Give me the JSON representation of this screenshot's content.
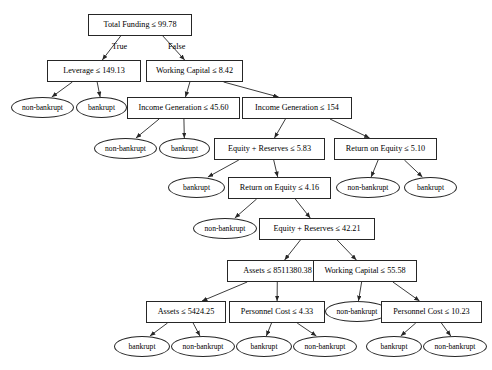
{
  "diagram": {
    "type": "decision-tree",
    "title": "",
    "label_true": "True",
    "label_false": "False",
    "stroke_color": "#262626",
    "fill_color": "#ffffff",
    "text_color": "#000000",
    "nodes": [
      {
        "id": "n0",
        "kind": "decision",
        "label": "Total Funding ≤ 99.78",
        "x": 88,
        "y": 14,
        "w": 104,
        "h": 22,
        "font": 8.2
      },
      {
        "id": "n1",
        "kind": "decision",
        "label": "Leverage ≤ 149.13",
        "x": 47,
        "y": 60,
        "w": 94,
        "h": 22,
        "font": 8.2
      },
      {
        "id": "n2",
        "kind": "decision",
        "label": "Working Capital ≤ 8.42",
        "x": 146,
        "y": 60,
        "w": 97,
        "h": 22,
        "font": 8.2
      },
      {
        "id": "n3",
        "kind": "leaf",
        "label": "non-bankrupt",
        "x": 11,
        "y": 97,
        "w": 63,
        "h": 21,
        "font": 7.6
      },
      {
        "id": "n4",
        "kind": "leaf",
        "label": "bankrupt",
        "x": 76,
        "y": 97,
        "w": 51,
        "h": 21,
        "font": 7.6
      },
      {
        "id": "n5",
        "kind": "decision",
        "label": "Income Generation ≤ 45.60",
        "x": 127,
        "y": 97,
        "w": 113,
        "h": 22,
        "font": 8.2
      },
      {
        "id": "n6",
        "kind": "decision",
        "label": "Income Generation ≤ 154",
        "x": 242,
        "y": 97,
        "w": 110,
        "h": 22,
        "font": 8.2
      },
      {
        "id": "n7",
        "kind": "leaf",
        "label": "non-bankrupt",
        "x": 94,
        "y": 138,
        "w": 63,
        "h": 21,
        "font": 7.6
      },
      {
        "id": "n8",
        "kind": "leaf",
        "label": "bankrupt",
        "x": 159,
        "y": 138,
        "w": 51,
        "h": 21,
        "font": 7.6
      },
      {
        "id": "n9",
        "kind": "decision",
        "label": "Equity + Reserves ≤ 5.83",
        "x": 214,
        "y": 138,
        "w": 111,
        "h": 22,
        "font": 8.2
      },
      {
        "id": "n10",
        "kind": "decision",
        "label": "Return on Equity ≤ 5.10",
        "x": 334,
        "y": 138,
        "w": 103,
        "h": 22,
        "font": 8.2
      },
      {
        "id": "n11",
        "kind": "leaf",
        "label": "bankrupt",
        "x": 168,
        "y": 177,
        "w": 57,
        "h": 21,
        "font": 7.6
      },
      {
        "id": "n12",
        "kind": "decision",
        "label": "Return on Equity ≤ 4.16",
        "x": 228,
        "y": 177,
        "w": 103,
        "h": 22,
        "font": 8.2
      },
      {
        "id": "n13",
        "kind": "leaf",
        "label": "non-bankrupt",
        "x": 336,
        "y": 177,
        "w": 64,
        "h": 21,
        "font": 7.6
      },
      {
        "id": "n14",
        "kind": "leaf",
        "label": "bankrupt",
        "x": 404,
        "y": 177,
        "w": 53,
        "h": 21,
        "font": 7.6
      },
      {
        "id": "n15",
        "kind": "leaf",
        "label": "non-bankrupt",
        "x": 193,
        "y": 218,
        "w": 64,
        "h": 21,
        "font": 7.6
      },
      {
        "id": "n16",
        "kind": "decision",
        "label": "Equity + Reserves ≤ 42.21",
        "x": 259,
        "y": 218,
        "w": 116,
        "h": 22,
        "font": 8.2
      },
      {
        "id": "n17",
        "kind": "decision",
        "label": "Assets ≤ 8511380.38",
        "x": 227,
        "y": 260,
        "w": 101,
        "h": 22,
        "font": 8.2
      },
      {
        "id": "n18",
        "kind": "decision",
        "label": "Working Capital ≤ 55.58",
        "x": 313,
        "y": 260,
        "w": 104,
        "h": 22,
        "font": 8.2
      },
      {
        "id": "n19",
        "kind": "decision",
        "label": "Assets ≤ 5424.25",
        "x": 146,
        "y": 301,
        "w": 80,
        "h": 22,
        "font": 8.2
      },
      {
        "id": "n20",
        "kind": "decision",
        "label": "Personnel Cost ≤ 4.33",
        "x": 229,
        "y": 301,
        "w": 96,
        "h": 22,
        "font": 8.2
      },
      {
        "id": "n21",
        "kind": "leaf",
        "label": "non-bankrupt",
        "x": 325,
        "y": 301,
        "w": 64,
        "h": 21,
        "font": 7.6
      },
      {
        "id": "n22",
        "kind": "decision",
        "label": "Personnel Cost ≤ 10.23",
        "x": 381,
        "y": 301,
        "w": 101,
        "h": 22,
        "font": 8.2
      },
      {
        "id": "n23",
        "kind": "leaf",
        "label": "bankrupt",
        "x": 114,
        "y": 336,
        "w": 56,
        "h": 21,
        "font": 7.6
      },
      {
        "id": "n24",
        "kind": "leaf",
        "label": "non-bankrupt",
        "x": 171,
        "y": 336,
        "w": 64,
        "h": 21,
        "font": 7.6
      },
      {
        "id": "n25",
        "kind": "leaf",
        "label": "bankrupt",
        "x": 236,
        "y": 336,
        "w": 56,
        "h": 21,
        "font": 7.6
      },
      {
        "id": "n26",
        "kind": "leaf",
        "label": "non-bankrupt",
        "x": 293,
        "y": 336,
        "w": 64,
        "h": 21,
        "font": 7.6
      },
      {
        "id": "n27",
        "kind": "leaf",
        "label": "bankrupt",
        "x": 366,
        "y": 336,
        "w": 56,
        "h": 21,
        "font": 7.6
      },
      {
        "id": "n28",
        "kind": "leaf",
        "label": "non-bankrupt",
        "x": 423,
        "y": 336,
        "w": 64,
        "h": 21,
        "font": 7.6
      }
    ],
    "edges": [
      {
        "from": "n0",
        "to": "n1",
        "label": "True"
      },
      {
        "from": "n0",
        "to": "n2",
        "label": "False"
      },
      {
        "from": "n1",
        "to": "n3",
        "label": ""
      },
      {
        "from": "n1",
        "to": "n4",
        "label": ""
      },
      {
        "from": "n2",
        "to": "n5",
        "label": ""
      },
      {
        "from": "n2",
        "to": "n6",
        "label": ""
      },
      {
        "from": "n5",
        "to": "n7",
        "label": ""
      },
      {
        "from": "n5",
        "to": "n8",
        "label": ""
      },
      {
        "from": "n6",
        "to": "n9",
        "label": ""
      },
      {
        "from": "n6",
        "to": "n10",
        "label": ""
      },
      {
        "from": "n9",
        "to": "n11",
        "label": ""
      },
      {
        "from": "n9",
        "to": "n12",
        "label": ""
      },
      {
        "from": "n10",
        "to": "n13",
        "label": ""
      },
      {
        "from": "n10",
        "to": "n14",
        "label": ""
      },
      {
        "from": "n12",
        "to": "n15",
        "label": ""
      },
      {
        "from": "n12",
        "to": "n16",
        "label": ""
      },
      {
        "from": "n16",
        "to": "n17",
        "label": ""
      },
      {
        "from": "n16",
        "to": "n18",
        "label": ""
      },
      {
        "from": "n17",
        "to": "n19",
        "label": ""
      },
      {
        "from": "n17",
        "to": "n20",
        "label": ""
      },
      {
        "from": "n18",
        "to": "n21",
        "label": ""
      },
      {
        "from": "n18",
        "to": "n22",
        "label": ""
      },
      {
        "from": "n19",
        "to": "n23",
        "label": ""
      },
      {
        "from": "n19",
        "to": "n24",
        "label": ""
      },
      {
        "from": "n20",
        "to": "n25",
        "label": ""
      },
      {
        "from": "n20",
        "to": "n26",
        "label": ""
      },
      {
        "from": "n22",
        "to": "n27",
        "label": ""
      },
      {
        "from": "n22",
        "to": "n28",
        "label": ""
      }
    ],
    "edge_labels": [
      {
        "text": "True",
        "x": 112,
        "y": 43
      },
      {
        "text": "False",
        "x": 168,
        "y": 43
      }
    ]
  }
}
